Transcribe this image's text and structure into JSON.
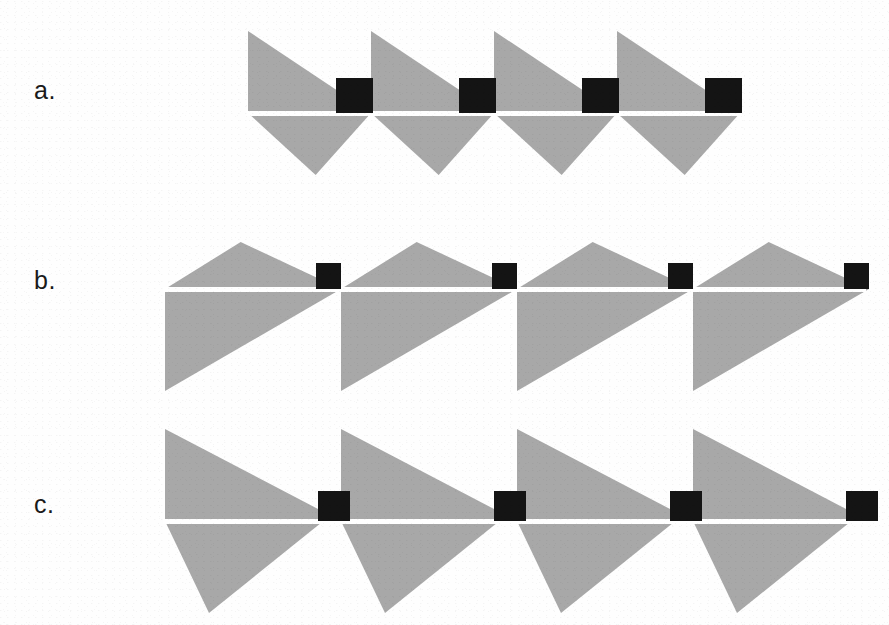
{
  "figure": {
    "background_color": "#fefefe",
    "width": 889,
    "height": 625,
    "gray_fill": "#a8a8a8",
    "marker_color": "#141414",
    "baseline_color": "#ffffff",
    "label_color": "#1a1a1a"
  },
  "rows": [
    {
      "id": "a",
      "label": "a.",
      "label_x": 34,
      "label_y": 76,
      "description": "Symmetric sawtooth: right-triangle above the baseline falling left-to-right, inverted triangle below the baseline; small black square sits on the baseline at the right of each period.",
      "baseline_y": 113,
      "baseline_x_start": 248,
      "baseline_x_end": 740,
      "unit_count": 4,
      "unit_width": 123,
      "unit_x_start": 248,
      "above_height": 82,
      "below_depth": 62,
      "above_shape": "right-triangle-apex-left",
      "below_shape": "inverted-triangle",
      "above_peak_frac": 0.0,
      "below_trough_frac": 0.55,
      "below_start_frac": 0.0,
      "below_end_frac": 1.0,
      "square": {
        "width": 37,
        "height": 35,
        "x_offset": 88,
        "sits_on": "baseline"
      }
    },
    {
      "id": "b",
      "label": "b.",
      "label_x": 34,
      "label_y": 289,
      "description": "Shallow triangular crest above the baseline peaking near mid-period, with a large right-triangle below the baseline falling left-to-right; small black square on the baseline at the right of each period.",
      "baseline_y": 289,
      "baseline_x_start": 165,
      "baseline_x_end": 864,
      "unit_count": 4,
      "unit_width": 176,
      "unit_x_start": 165,
      "above_height": 47,
      "below_depth": 102,
      "above_shape": "triangular-crest",
      "below_shape": "right-triangle-apex-left",
      "above_peak_frac": 0.43,
      "below_trough_frac": 0.0,
      "below_start_frac": 0.0,
      "below_end_frac": 1.0,
      "square": {
        "width": 25,
        "height": 26,
        "x_offset": 151,
        "sits_on": "baseline"
      }
    },
    {
      "id": "c",
      "label": "c.",
      "label_x": 34,
      "label_y": 513,
      "description": "Tall right-triangle above the baseline falling left-to-right paired with a wedge below the baseline; small black square on the baseline at the right of each period.",
      "baseline_y": 521,
      "baseline_x_start": 165,
      "baseline_x_end": 864,
      "unit_count": 4,
      "unit_width": 176,
      "unit_x_start": 165,
      "above_height": 92,
      "below_depth": 92,
      "above_shape": "right-triangle-apex-left",
      "below_shape": "wedge",
      "above_peak_frac": 0.0,
      "below_trough_frac": 0.25,
      "below_start_frac": 0.0,
      "below_end_frac": 0.9,
      "square": {
        "width": 32,
        "height": 30,
        "x_offset": 153,
        "sits_on": "baseline"
      }
    }
  ]
}
